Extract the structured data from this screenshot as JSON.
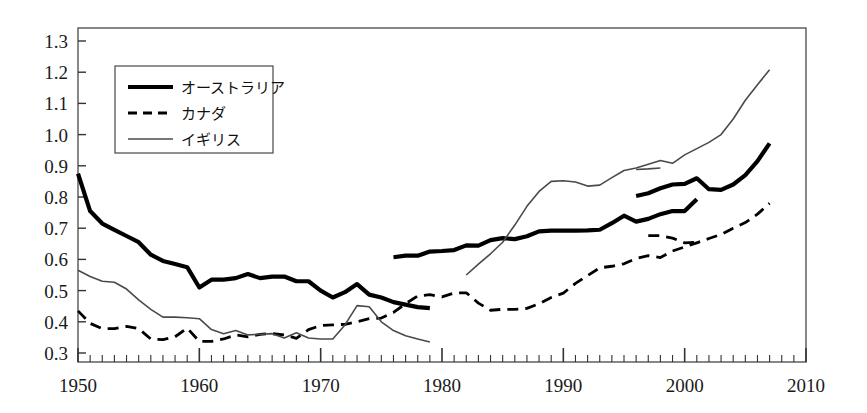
{
  "chart_data": {
    "type": "line",
    "title": "",
    "xlabel": "",
    "ylabel": "",
    "xlim": [
      1950,
      2010
    ],
    "ylim": [
      0.3,
      1.3
    ],
    "xticks": [
      1950,
      1960,
      1970,
      1980,
      1990,
      2000,
      2010
    ],
    "yticks": [
      0.3,
      0.4,
      0.5,
      0.6,
      0.7,
      0.8,
      0.9,
      1.0,
      1.1,
      1.2,
      1.3
    ],
    "xtick_labels": [
      "1950",
      "1960",
      "1970",
      "1980",
      "1990",
      "2000",
      "2010"
    ],
    "ytick_labels": [
      "0.3",
      "0.4",
      "0.5",
      "0.6",
      "0.7",
      "0.8",
      "0.9",
      "1.0",
      "1.1",
      "1.2",
      "1.3"
    ],
    "minor_xtick_interval": 1,
    "grid": false,
    "legend_position": "upper-left-inside",
    "series": [
      {
        "name": "オーストラリア",
        "style": "thick-solid",
        "color": "#000000",
        "width": 4.2,
        "segments": [
          {
            "x": [
              1950,
              1951,
              1952,
              1953,
              1954,
              1955,
              1956,
              1957,
              1958,
              1959,
              1960,
              1961,
              1962,
              1963,
              1964,
              1965,
              1966,
              1967,
              1968,
              1969,
              1970,
              1971,
              1972,
              1973,
              1974,
              1975,
              1976,
              1977,
              1978,
              1979
            ],
            "y": [
              0.875,
              0.755,
              0.715,
              0.695,
              0.675,
              0.655,
              0.615,
              0.595,
              0.585,
              0.575,
              0.51,
              0.535,
              0.535,
              0.54,
              0.553,
              0.54,
              0.545,
              0.545,
              0.53,
              0.53,
              0.5,
              0.478,
              0.495,
              0.521,
              0.487,
              0.478,
              0.463,
              0.455,
              0.447,
              0.444
            ]
          },
          {
            "x": [
              1976,
              1977,
              1978,
              1979,
              1980,
              1981,
              1982,
              1983,
              1984,
              1985,
              1986,
              1987,
              1988,
              1989,
              1990,
              1991,
              1992,
              1993,
              1994,
              1995,
              1996,
              1997,
              1998,
              1999,
              2000,
              2001
            ],
            "y": [
              0.607,
              0.612,
              0.612,
              0.625,
              0.627,
              0.63,
              0.645,
              0.644,
              0.662,
              0.668,
              0.665,
              0.674,
              0.69,
              0.692,
              0.692,
              0.692,
              0.693,
              0.695,
              0.716,
              0.74,
              0.721,
              0.73,
              0.745,
              0.755,
              0.755,
              0.793
            ]
          },
          {
            "x": [
              1996,
              1997,
              1998,
              1999,
              2000,
              2001,
              2002,
              2003,
              2004,
              2005,
              2006,
              2007
            ],
            "y": [
              0.803,
              0.812,
              0.828,
              0.84,
              0.842,
              0.86,
              0.825,
              0.823,
              0.84,
              0.87,
              0.915,
              0.972
            ]
          }
        ]
      },
      {
        "name": "カナダ",
        "style": "dashed",
        "color": "#000000",
        "width": 2.8,
        "segments": [
          {
            "x": [
              1950,
              1951,
              1952,
              1953,
              1954,
              1955,
              1956,
              1957,
              1958,
              1959,
              1960,
              1961,
              1962,
              1963,
              1964,
              1965,
              1966,
              1967,
              1968,
              1969,
              1970,
              1971,
              1972,
              1973,
              1974,
              1975,
              1976,
              1977,
              1978,
              1979,
              1980,
              1981,
              1982,
              1983,
              1984,
              1985,
              1986,
              1987,
              1988,
              1989,
              1990,
              1991,
              1992,
              1993,
              1994,
              1995,
              1996,
              1997,
              1998,
              1999,
              2000,
              2001,
              2002,
              2003,
              2004,
              2005,
              2006,
              2007
            ],
            "y": [
              0.435,
              0.395,
              0.378,
              0.378,
              0.385,
              0.378,
              0.345,
              0.343,
              0.352,
              0.38,
              0.337,
              0.337,
              0.345,
              0.358,
              0.352,
              0.36,
              0.362,
              0.358,
              0.347,
              0.375,
              0.388,
              0.39,
              0.392,
              0.4,
              0.41,
              0.412,
              0.43,
              0.458,
              0.483,
              0.487,
              0.48,
              0.492,
              0.493,
              0.46,
              0.437,
              0.44,
              0.44,
              0.443,
              0.458,
              0.478,
              0.492,
              0.523,
              0.548,
              0.573,
              0.578,
              0.586,
              0.603,
              0.612,
              0.606,
              0.627,
              0.64,
              0.653,
              0.667,
              0.68,
              0.7,
              0.718,
              0.745,
              0.78
            ]
          },
          {
            "x": [
              1997,
              1998,
              1999,
              2000,
              2001
            ],
            "y": [
              0.676,
              0.676,
              0.668,
              0.653,
              0.655
            ]
          }
        ]
      },
      {
        "name": "イギリス",
        "style": "thin-solid",
        "color": "#4a4a4a",
        "width": 1.6,
        "segments": [
          {
            "x": [
              1950,
              1951,
              1952,
              1953,
              1954,
              1955,
              1956,
              1957,
              1958,
              1959,
              1960,
              1961,
              1962,
              1963,
              1964,
              1965,
              1966,
              1967,
              1968,
              1969,
              1970,
              1971,
              1972,
              1973,
              1974,
              1975,
              1976,
              1977,
              1978,
              1979
            ],
            "y": [
              0.565,
              0.545,
              0.53,
              0.527,
              0.505,
              0.47,
              0.44,
              0.415,
              0.415,
              0.413,
              0.41,
              0.375,
              0.362,
              0.372,
              0.358,
              0.36,
              0.362,
              0.348,
              0.365,
              0.348,
              0.345,
              0.345,
              0.39,
              0.452,
              0.448,
              0.4,
              0.372,
              0.355,
              0.345,
              0.335
            ]
          },
          {
            "x": [
              1982,
              1983,
              1984,
              1985,
              1986,
              1987,
              1988,
              1989,
              1990,
              1991,
              1992,
              1993,
              1994,
              1995,
              1996,
              1997,
              1998,
              1999,
              2000,
              2001,
              2002,
              2003,
              2004,
              2005,
              2006,
              2007
            ],
            "y": [
              0.55,
              0.585,
              0.618,
              0.655,
              0.71,
              0.77,
              0.818,
              0.85,
              0.852,
              0.848,
              0.835,
              0.838,
              0.862,
              0.885,
              0.893,
              0.905,
              0.917,
              0.908,
              0.935,
              0.955,
              0.975,
              1.0,
              1.05,
              1.11,
              1.16,
              1.208
            ]
          },
          {
            "x": [
              1996,
              1997,
              1998
            ],
            "y": [
              0.888,
              0.89,
              0.893
            ]
          }
        ]
      }
    ],
    "legend_entries": [
      {
        "label": "オーストラリア",
        "style": "thick-solid"
      },
      {
        "label": "カナダ",
        "style": "dashed"
      },
      {
        "label": "イギリス",
        "style": "thin-solid"
      }
    ]
  },
  "axes": {
    "frame_color": "#555555"
  }
}
